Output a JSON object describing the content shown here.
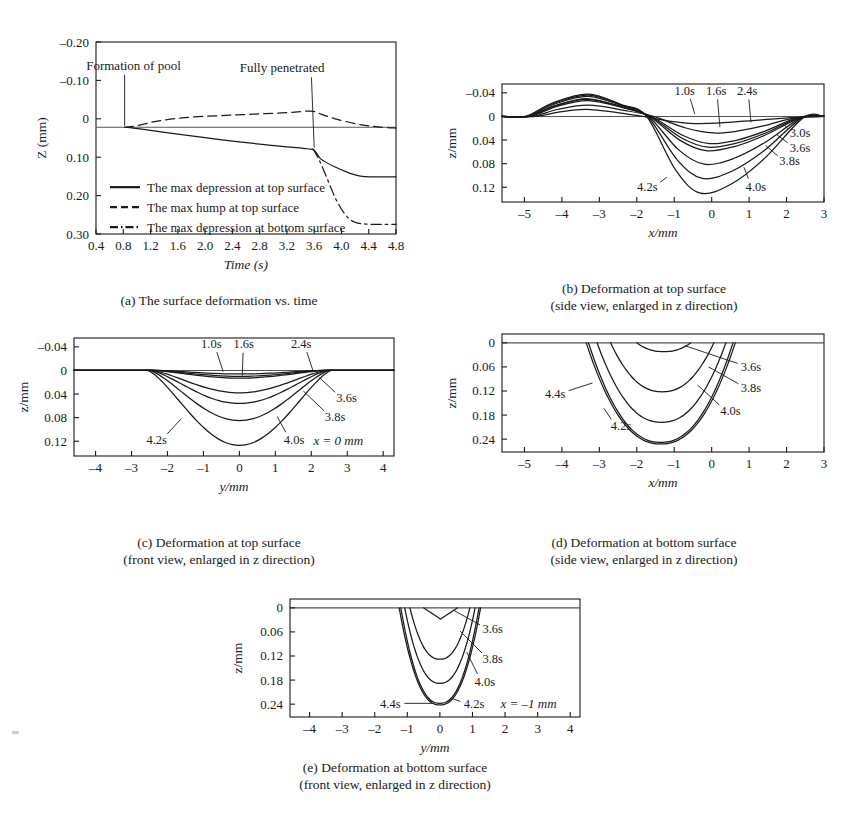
{
  "figure": {
    "background": "#ffffff",
    "ink": "#1a1a1a"
  },
  "chart_data": [
    {
      "id": "panel-a",
      "type": "line",
      "title": "(a) The surface deformation vs. time",
      "caption_lines": [
        "(a) The surface deformation vs. time"
      ],
      "xlabel": "Time (s)",
      "ylabel": "Z (mm)",
      "xlim": [
        0.4,
        4.8
      ],
      "ylim": [
        -0.2,
        0.3
      ],
      "y_inverted": true,
      "xticks": [
        0.4,
        0.8,
        1.2,
        1.6,
        2.0,
        2.4,
        2.8,
        3.2,
        3.6,
        4.0,
        4.4,
        4.8
      ],
      "xticklabels": [
        "0.4",
        "0.8",
        "1.2",
        "1.6",
        "2.0",
        "2.4",
        "2.8",
        "3.2",
        "3.6",
        "4.0",
        "4.4",
        "4.8"
      ],
      "yticks": [
        -0.2,
        -0.1,
        0,
        0.1,
        0.2,
        0.3
      ],
      "yticklabels": [
        "–0.20",
        "–0.10",
        "0",
        "0.10",
        "0.20",
        "0.30"
      ],
      "grid": false,
      "zero_reference": 0.022,
      "annotations": [
        {
          "text": "Formation of pool",
          "x": 0.95,
          "y": -0.138,
          "pointer_from": [
            0.82,
            -0.115
          ],
          "pointer_to": [
            0.82,
            0.018
          ]
        },
        {
          "text": "Fully penetrated",
          "x": 3.13,
          "y": -0.133,
          "pointer_from": [
            3.56,
            -0.108
          ],
          "pointer_to": [
            3.6,
            0.075
          ]
        }
      ],
      "legend": {
        "position": "lower-left-inside",
        "entries": [
          {
            "label": "The max depression at top surface",
            "style": "solid"
          },
          {
            "label": "The max hump at top surface",
            "style": "dashed"
          },
          {
            "label": "The max depression at bottom surface",
            "style": "dashdot"
          }
        ]
      },
      "series": [
        {
          "name": "The max depression at top surface",
          "style": "solid",
          "points": [
            [
              0.82,
              0.022
            ],
            [
              0.95,
              0.024
            ],
            [
              1.2,
              0.03
            ],
            [
              1.6,
              0.04
            ],
            [
              2.0,
              0.049
            ],
            [
              2.4,
              0.058
            ],
            [
              2.8,
              0.066
            ],
            [
              3.2,
              0.073
            ],
            [
              3.5,
              0.078
            ],
            [
              3.6,
              0.082
            ],
            [
              3.7,
              0.105
            ],
            [
              3.9,
              0.125
            ],
            [
              4.1,
              0.14
            ],
            [
              4.3,
              0.15
            ],
            [
              4.5,
              0.151
            ],
            [
              4.8,
              0.151
            ]
          ]
        },
        {
          "name": "The max hump at top surface",
          "style": "dashed",
          "points": [
            [
              0.82,
              0.022
            ],
            [
              1.0,
              0.018
            ],
            [
              1.3,
              0.006
            ],
            [
              1.7,
              -0.003
            ],
            [
              2.2,
              -0.008
            ],
            [
              2.7,
              -0.012
            ],
            [
              3.2,
              -0.016
            ],
            [
              3.55,
              -0.02
            ],
            [
              3.7,
              -0.012
            ],
            [
              3.95,
              0.002
            ],
            [
              4.3,
              0.016
            ],
            [
              4.6,
              0.022
            ],
            [
              4.8,
              0.024
            ]
          ]
        },
        {
          "name": "The max depression at bottom surface",
          "style": "dashdot",
          "points": [
            [
              3.58,
              0.078
            ],
            [
              3.68,
              0.11
            ],
            [
              3.8,
              0.16
            ],
            [
              3.92,
              0.21
            ],
            [
              4.05,
              0.248
            ],
            [
              4.18,
              0.268
            ],
            [
              4.35,
              0.274
            ],
            [
              4.6,
              0.275
            ],
            [
              4.8,
              0.275
            ]
          ]
        }
      ]
    },
    {
      "id": "panel-b",
      "type": "line",
      "caption_lines": [
        "(b) Deformation at top surface",
        "(side view, enlarged in z direction)"
      ],
      "xlabel": "x/mm",
      "ylabel": "z/mm",
      "xlim": [
        -5.6,
        3.0
      ],
      "ylim": [
        -0.055,
        0.145
      ],
      "y_inverted": true,
      "xticks": [
        -5,
        -4,
        -3,
        -2,
        -1,
        0,
        1,
        2,
        3
      ],
      "xticklabels": [
        "–5",
        "–4",
        "–3",
        "–2",
        "–1",
        "0",
        "1",
        "2",
        "3"
      ],
      "yticks": [
        -0.04,
        0,
        0.04,
        0.08,
        0.12
      ],
      "yticklabels": [
        "–0.04",
        "0",
        "0.04",
        "0.08",
        "0.12"
      ],
      "grid": false,
      "time_labels": [
        "1.0s",
        "1.6s",
        "2.4s",
        "3.0s",
        "3.6s",
        "3.8s",
        "4.0s",
        "4.2s"
      ],
      "annotations": [
        {
          "text": "1.0s",
          "x": -0.72,
          "y": -0.044,
          "leader_to": [
            -0.45,
            -0.004
          ]
        },
        {
          "text": "1.6s",
          "x": 0.12,
          "y": -0.044,
          "leader_to": [
            0.22,
            0.018
          ]
        },
        {
          "text": "2.4s",
          "x": 0.95,
          "y": -0.044,
          "leader_to": [
            1.05,
            0.01
          ]
        },
        {
          "text": "3.0s",
          "x": 2.36,
          "y": 0.028,
          "leader_to": [
            1.92,
            0.013
          ]
        },
        {
          "text": "3.6s",
          "x": 2.36,
          "y": 0.052,
          "leader_to": [
            1.72,
            0.03
          ]
        },
        {
          "text": "3.8s",
          "x": 2.08,
          "y": 0.075,
          "leader_to": [
            1.44,
            0.049
          ]
        },
        {
          "text": "4.0s",
          "x": 1.18,
          "y": 0.118,
          "leader_to": [
            0.86,
            0.086
          ]
        },
        {
          "text": "4.2s",
          "x": -1.72,
          "y": 0.118,
          "leader_to": [
            -1.2,
            0.103
          ]
        }
      ],
      "series": [
        {
          "name": "1.0s",
          "hump_x": -3.35,
          "hump_z": -0.012,
          "dip_x": -0.45,
          "dip_z": 0.012,
          "left_x": -4.7,
          "right_x": 2.15
        },
        {
          "name": "1.6s",
          "hump_x": -3.3,
          "hump_z": -0.019,
          "dip_x": 0.05,
          "dip_z": 0.028,
          "left_x": -4.8,
          "right_x": 2.25
        },
        {
          "name": "2.4s",
          "hump_x": -3.3,
          "hump_z": -0.027,
          "dip_x": -0.05,
          "dip_z": 0.046,
          "left_x": -4.85,
          "right_x": 2.3
        },
        {
          "name": "3.0s",
          "hump_x": -3.3,
          "hump_z": -0.029,
          "dip_x": -0.1,
          "dip_z": 0.052,
          "left_x": -4.9,
          "right_x": 2.35
        },
        {
          "name": "3.6s",
          "hump_x": -3.3,
          "hump_z": -0.03,
          "dip_x": -0.15,
          "dip_z": 0.058,
          "left_x": -4.9,
          "right_x": 2.38
        },
        {
          "name": "3.8s",
          "hump_x": -3.3,
          "hump_z": -0.034,
          "dip_x": -0.2,
          "dip_z": 0.081,
          "left_x": -4.92,
          "right_x": 2.4
        },
        {
          "name": "4.0s",
          "hump_x": -3.3,
          "hump_z": -0.036,
          "dip_x": -0.25,
          "dip_z": 0.105,
          "left_x": -4.95,
          "right_x": 2.42
        },
        {
          "name": "4.2s",
          "hump_x": -3.3,
          "hump_z": -0.038,
          "dip_x": -0.3,
          "dip_z": 0.13,
          "left_x": -4.98,
          "right_x": 2.45
        }
      ]
    },
    {
      "id": "panel-c",
      "type": "line",
      "caption_lines": [
        "(c) Deformation at top surface",
        "(front view, enlarged in z direction)"
      ],
      "xlabel": "y/mm",
      "ylabel": "z/mm",
      "xlim": [
        -4.6,
        4.3
      ],
      "ylim": [
        -0.055,
        0.145
      ],
      "y_inverted": true,
      "xticks": [
        -4,
        -3,
        -2,
        -1,
        0,
        1,
        2,
        3,
        4
      ],
      "xticklabels": [
        "–4",
        "–3",
        "–2",
        "–1",
        "0",
        "1",
        "2",
        "3",
        "4"
      ],
      "yticks": [
        -0.04,
        0,
        0.04,
        0.08,
        0.12
      ],
      "yticklabels": [
        "–0.04",
        "0",
        "0.04",
        "0.08",
        "0.12"
      ],
      "grid": false,
      "note": "x = 0 mm",
      "note_pos": [
        2.75,
        0.118
      ],
      "annotations": [
        {
          "text": "1.0s",
          "x": -0.78,
          "y": -0.045,
          "leader_to": [
            -0.45,
            0.002
          ]
        },
        {
          "text": "1.6s",
          "x": 0.12,
          "y": -0.045,
          "leader_to": [
            0.08,
            0.009
          ]
        },
        {
          "text": "2.4s",
          "x": 1.72,
          "y": -0.045,
          "leader_to": [
            2.05,
            0.001
          ]
        },
        {
          "text": "3.6s",
          "x": 2.98,
          "y": 0.046,
          "leader_to": [
            2.22,
            0.012
          ]
        },
        {
          "text": "3.8s",
          "x": 2.66,
          "y": 0.078,
          "leader_to": [
            1.78,
            0.035
          ]
        },
        {
          "text": "4.0s",
          "x": 1.52,
          "y": 0.117,
          "leader_to": [
            1.05,
            0.078
          ]
        },
        {
          "text": "4.2s",
          "x": -2.3,
          "y": 0.117,
          "leader_to": [
            -1.62,
            0.082
          ]
        }
      ],
      "series": [
        {
          "name": "1.0s",
          "half_width": 2.25,
          "depth": 0.006
        },
        {
          "name": "1.6s",
          "half_width": 2.32,
          "depth": 0.01
        },
        {
          "name": "2.4s",
          "half_width": 2.38,
          "depth": 0.013
        },
        {
          "name": "3.6s",
          "half_width": 2.42,
          "depth": 0.038
        },
        {
          "name": "3.8s",
          "half_width": 2.46,
          "depth": 0.056
        },
        {
          "name": "4.0s",
          "half_width": 2.5,
          "depth": 0.085
        },
        {
          "name": "4.2s",
          "half_width": 2.55,
          "depth": 0.127
        }
      ]
    },
    {
      "id": "panel-d",
      "type": "line",
      "caption_lines": [
        "(d) Deformation at bottom surface",
        "(side view, enlarged in z direction)"
      ],
      "xlabel": "x/mm",
      "ylabel": "z/mm",
      "xlim": [
        -5.6,
        3.0
      ],
      "ylim": [
        -0.022,
        0.272
      ],
      "y_inverted": true,
      "xticks": [
        -5,
        -4,
        -3,
        -2,
        -1,
        0,
        1,
        2,
        3
      ],
      "xticklabels": [
        "–5",
        "–4",
        "–3",
        "–2",
        "–1",
        "0",
        "1",
        "2",
        "3"
      ],
      "yticks": [
        0,
        0.06,
        0.12,
        0.18,
        0.24
      ],
      "yticklabels": [
        "0",
        "0.06",
        "0.12",
        "0.18",
        "0.24"
      ],
      "grid": false,
      "annotations": [
        {
          "text": "3.6s",
          "x": 1.05,
          "y": 0.058,
          "leader_to": [
            -0.72,
            0.007
          ]
        },
        {
          "text": "3.8s",
          "x": 1.05,
          "y": 0.112,
          "leader_to": [
            -0.08,
            0.06
          ]
        },
        {
          "text": "4.0s",
          "x": 0.5,
          "y": 0.168,
          "leader_to": [
            -0.38,
            0.105
          ]
        },
        {
          "text": "4.2s",
          "x": -2.42,
          "y": 0.206,
          "leader_to": [
            -2.88,
            0.163
          ]
        },
        {
          "text": "4.4s",
          "x": -4.18,
          "y": 0.125,
          "leader_to": [
            -3.18,
            0.1
          ]
        }
      ],
      "series": [
        {
          "name": "3.6s",
          "center": -1.28,
          "half_width": 0.72,
          "depth": 0.022
        },
        {
          "name": "3.8s",
          "center": -1.32,
          "half_width": 1.38,
          "depth": 0.122
        },
        {
          "name": "4.0s",
          "center": -1.34,
          "half_width": 1.72,
          "depth": 0.198
        },
        {
          "name": "4.2s",
          "center": -1.36,
          "half_width": 1.93,
          "depth": 0.248
        },
        {
          "name": "4.4s",
          "center": -1.36,
          "half_width": 1.99,
          "depth": 0.252
        }
      ]
    },
    {
      "id": "panel-e",
      "type": "line",
      "caption_lines": [
        "(e) Deformation at bottom surface",
        "(front view, enlarged in z direction)"
      ],
      "xlabel": "y/mm",
      "ylabel": "z/mm",
      "xlim": [
        -4.6,
        4.3
      ],
      "ylim": [
        -0.022,
        0.272
      ],
      "y_inverted": true,
      "xticks": [
        -4,
        -3,
        -2,
        -1,
        0,
        1,
        2,
        3,
        4
      ],
      "xticklabels": [
        "–4",
        "–3",
        "–2",
        "–1",
        "0",
        "1",
        "2",
        "3",
        "4"
      ],
      "yticks": [
        0,
        0.06,
        0.12,
        0.18,
        0.24
      ],
      "yticklabels": [
        "0",
        "0.06",
        "0.12",
        "0.18",
        "0.24"
      ],
      "grid": false,
      "note": "x = –1 mm",
      "note_pos": [
        2.72,
        0.238
      ],
      "annotations": [
        {
          "text": "3.6s",
          "x": 1.62,
          "y": 0.052,
          "leader_to": [
            0.42,
            0.006
          ]
        },
        {
          "text": "3.8s",
          "x": 1.62,
          "y": 0.127,
          "leader_to": [
            0.62,
            0.058
          ]
        },
        {
          "text": "4.0s",
          "x": 1.38,
          "y": 0.184,
          "leader_to": [
            0.82,
            0.11
          ]
        },
        {
          "text": "4.2s",
          "x": 1.05,
          "y": 0.238,
          "leader_to": [
            0.38,
            0.226
          ]
        },
        {
          "text": "4.4s",
          "x": -1.52,
          "y": 0.238,
          "leader_to": [
            -0.22,
            0.238
          ]
        }
      ],
      "series": [
        {
          "name": "3.6s",
          "center": 0.02,
          "half_width": 0.52,
          "depth": 0.028
        },
        {
          "name": "3.8s",
          "center": 0.0,
          "half_width": 0.92,
          "depth": 0.128
        },
        {
          "name": "4.0s",
          "center": 0.0,
          "half_width": 1.08,
          "depth": 0.188
        },
        {
          "name": "4.2s",
          "center": 0.0,
          "half_width": 1.2,
          "depth": 0.238
        },
        {
          "name": "4.4s",
          "center": 0.0,
          "half_width": 1.25,
          "depth": 0.242
        }
      ]
    }
  ]
}
